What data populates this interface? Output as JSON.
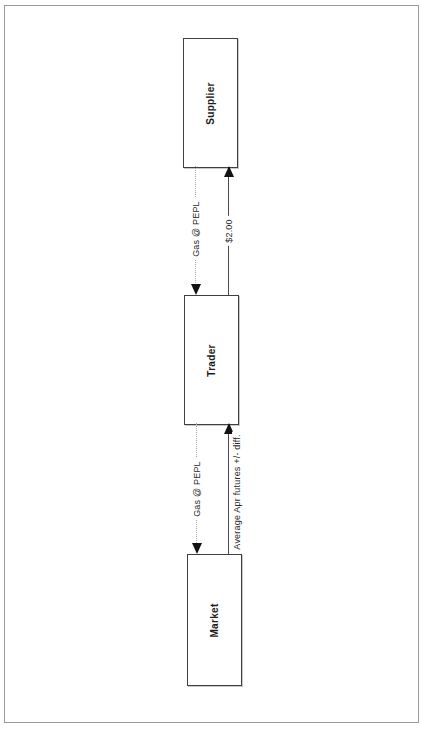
{
  "page": {
    "background_color": "#ffffff",
    "frame_border_color": "#9a9a9a"
  },
  "diagram": {
    "type": "flow-diagram",
    "orientation": "rotated 90 degrees (landscape page scanned in portrait)",
    "nodes": [
      {
        "id": "supplier",
        "label": "Supplier"
      },
      {
        "id": "trader",
        "label": "Trader"
      },
      {
        "id": "market",
        "label": "Market"
      }
    ],
    "edges": [
      {
        "from": "Supplier",
        "to": "Trader",
        "label": "Gas @ PEPL",
        "line_style": "dotted",
        "arrow_direction": "toward Trader"
      },
      {
        "from": "Trader",
        "to": "Supplier",
        "label": "$2.00",
        "line_style": "solid",
        "arrow_direction": "toward Supplier"
      },
      {
        "from": "Trader",
        "to": "Market",
        "label": "Gas @ PEPL",
        "line_style": "dotted",
        "arrow_direction": "toward Market"
      },
      {
        "from": "Market",
        "to": "Trader",
        "label": "Average Apr futures +/- diff.",
        "line_style": "solid",
        "arrow_direction": "toward Trader"
      }
    ]
  }
}
